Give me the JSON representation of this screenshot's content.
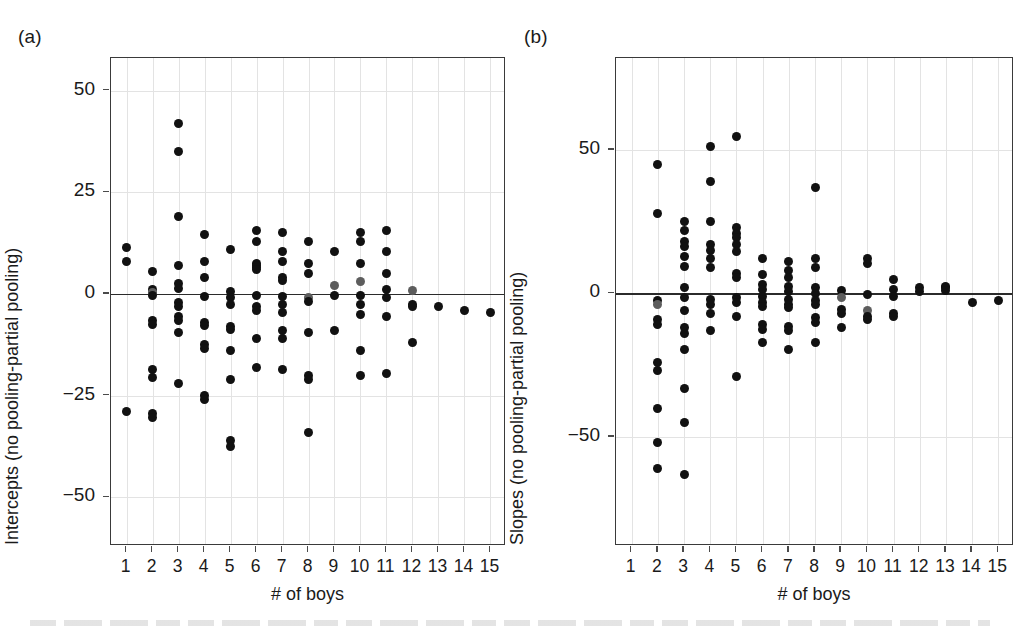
{
  "figure": {
    "background": "#ffffff",
    "point_color": "#111111",
    "point_color_faded": "#5d5d5d",
    "axis_color": "#3a3a3a",
    "grid_color": "#e3e3e3",
    "zero_line_color": "#2b2b2b"
  },
  "panels": [
    {
      "label": "(a)",
      "frame": {
        "left": 110,
        "top": 57,
        "width": 395,
        "height": 488
      },
      "label_pos": {
        "left": 18,
        "top": 26
      },
      "chart_data": {
        "type": "scatter",
        "title": "",
        "xlabel": "# of boys",
        "ylabel": "Intercepts (no pooling-partial pooling)",
        "xlim": [
          0.4,
          15.6
        ],
        "ylim": [
          -62,
          58
        ],
        "xticks": [
          1,
          2,
          3,
          4,
          5,
          6,
          7,
          8,
          9,
          10,
          11,
          12,
          13,
          14,
          15
        ],
        "yticks": [
          50,
          25,
          0,
          -25,
          -50
        ],
        "grid": true,
        "zero_reference_line": 0,
        "points": [
          [
            1,
            11.5
          ],
          [
            1,
            8.0
          ],
          [
            2,
            5.5
          ],
          [
            2,
            1.0
          ],
          [
            2,
            0.4
          ],
          [
            2,
            -0.4
          ],
          [
            2,
            -6.5
          ],
          [
            2,
            -7.5
          ],
          [
            2,
            -18.5
          ],
          [
            2,
            -20.5
          ],
          [
            2,
            -29.5
          ],
          [
            2,
            -30.5
          ],
          [
            1,
            -29.0
          ],
          [
            3,
            42.0
          ],
          [
            3,
            35.0
          ],
          [
            3,
            19.0
          ],
          [
            3,
            7.0
          ],
          [
            3,
            2.5
          ],
          [
            3,
            1.2
          ],
          [
            3,
            -2.0
          ],
          [
            3,
            -3.0
          ],
          [
            3,
            -5.5
          ],
          [
            3,
            -6.5
          ],
          [
            3,
            -9.5
          ],
          [
            3,
            -22.0
          ],
          [
            4,
            14.5
          ],
          [
            4,
            8.0
          ],
          [
            4,
            4.0
          ],
          [
            4,
            -0.6
          ],
          [
            4,
            -7.0
          ],
          [
            4,
            -7.8
          ],
          [
            4,
            -12.5
          ],
          [
            4,
            -13.5
          ],
          [
            4,
            -25.0
          ],
          [
            4,
            -26.0
          ],
          [
            5,
            11.0
          ],
          [
            5,
            0.5
          ],
          [
            5,
            -0.8
          ],
          [
            5,
            -2.5
          ],
          [
            5,
            -8.0
          ],
          [
            5,
            -8.8
          ],
          [
            5,
            -14.0
          ],
          [
            5,
            -21.0
          ],
          [
            5,
            -36.0
          ],
          [
            5,
            -37.5
          ],
          [
            6,
            13.0
          ],
          [
            6,
            15.5
          ],
          [
            6,
            7.5
          ],
          [
            6,
            6.5
          ],
          [
            6,
            7.0
          ],
          [
            6,
            6.0
          ],
          [
            6,
            -0.5
          ],
          [
            6,
            -3.0
          ],
          [
            6,
            -4.0
          ],
          [
            6,
            -11.0
          ],
          [
            6,
            -18.0
          ],
          [
            7,
            15.0
          ],
          [
            7,
            10.5
          ],
          [
            7,
            8.0
          ],
          [
            7,
            4.0
          ],
          [
            7,
            3.2
          ],
          [
            7,
            -0.6
          ],
          [
            7,
            -2.5
          ],
          [
            7,
            -4.5
          ],
          [
            7,
            -9.0
          ],
          [
            7,
            -11.0
          ],
          [
            7,
            -18.5
          ],
          [
            8,
            13.0
          ],
          [
            8,
            7.5
          ],
          [
            8,
            5.0
          ],
          [
            8,
            -1.0
          ],
          [
            8,
            -1.8
          ],
          [
            8,
            -9.5
          ],
          [
            8,
            -20.0
          ],
          [
            8,
            -21.0
          ],
          [
            8,
            -34.0
          ],
          [
            9,
            10.5
          ],
          [
            9,
            2.0
          ],
          [
            9,
            -0.5
          ],
          [
            9,
            -9.0
          ],
          [
            10,
            15.0
          ],
          [
            10,
            13.0
          ],
          [
            10,
            7.5
          ],
          [
            10,
            3.0
          ],
          [
            10,
            -0.5
          ],
          [
            10,
            -2.5
          ],
          [
            10,
            -5.0
          ],
          [
            10,
            -14.0
          ],
          [
            10,
            -20.0
          ],
          [
            11,
            15.5
          ],
          [
            11,
            10.5
          ],
          [
            11,
            5.0
          ],
          [
            11,
            1.0
          ],
          [
            11,
            -0.8
          ],
          [
            11,
            -5.5
          ],
          [
            11,
            -19.5
          ],
          [
            12,
            0.8
          ],
          [
            12,
            -2.5
          ],
          [
            12,
            -3.2
          ],
          [
            12,
            -12.0
          ],
          [
            13,
            -3.0
          ],
          [
            14,
            -4.0
          ],
          [
            15,
            -4.5
          ]
        ],
        "faded_points": [
          [
            2,
            0.4
          ],
          [
            9,
            2.0
          ],
          [
            10,
            3.0
          ],
          [
            12,
            0.8
          ],
          [
            8,
            -1.0
          ]
        ]
      }
    },
    {
      "label": "(b)",
      "frame": {
        "left": 615,
        "top": 57,
        "width": 398,
        "height": 488
      },
      "label_pos": {
        "left": 524,
        "top": 26
      },
      "chart_data": {
        "type": "scatter",
        "title": "",
        "xlabel": "# of boys",
        "ylabel": "Slopes (no pooling-partial pooling)",
        "xlim": [
          0.4,
          15.6
        ],
        "ylim": [
          -88,
          82
        ],
        "xticks": [
          1,
          2,
          3,
          4,
          5,
          6,
          7,
          8,
          9,
          10,
          11,
          12,
          13,
          14,
          15
        ],
        "yticks": [
          50,
          0,
          -50
        ],
        "grid": true,
        "zero_reference_line": 0,
        "points": [
          [
            2,
            45.0
          ],
          [
            2,
            28.0
          ],
          [
            2,
            -2.5
          ],
          [
            2,
            -4.0
          ],
          [
            2,
            -9.0
          ],
          [
            2,
            -11.0
          ],
          [
            2,
            -24.0
          ],
          [
            2,
            -27.0
          ],
          [
            2,
            -40.0
          ],
          [
            2,
            -52.0
          ],
          [
            2,
            -61.0
          ],
          [
            3,
            25.0
          ],
          [
            3,
            22.0
          ],
          [
            3,
            18.0
          ],
          [
            3,
            16.5
          ],
          [
            3,
            13.0
          ],
          [
            3,
            9.5
          ],
          [
            3,
            2.0
          ],
          [
            3,
            -1.5
          ],
          [
            3,
            -6.0
          ],
          [
            3,
            -12.0
          ],
          [
            3,
            -14.0
          ],
          [
            3,
            -19.5
          ],
          [
            3,
            -33.0
          ],
          [
            3,
            -45.0
          ],
          [
            3,
            -63.0
          ],
          [
            4,
            51.0
          ],
          [
            4,
            39.0
          ],
          [
            4,
            25.0
          ],
          [
            4,
            17.0
          ],
          [
            4,
            15.0
          ],
          [
            4,
            12.0
          ],
          [
            4,
            9.0
          ],
          [
            4,
            -2.0
          ],
          [
            4,
            -4.0
          ],
          [
            4,
            -7.0
          ],
          [
            4,
            -13.0
          ],
          [
            5,
            54.5
          ],
          [
            5,
            23.0
          ],
          [
            5,
            21.0
          ],
          [
            5,
            19.5
          ],
          [
            5,
            17.0
          ],
          [
            5,
            14.5
          ],
          [
            5,
            7.0
          ],
          [
            5,
            5.5
          ],
          [
            5,
            -1.5
          ],
          [
            5,
            -3.0
          ],
          [
            5,
            -8.0
          ],
          [
            5,
            -29.0
          ],
          [
            6,
            12.0
          ],
          [
            6,
            6.5
          ],
          [
            6,
            3.0
          ],
          [
            6,
            1.5
          ],
          [
            6,
            -1.0
          ],
          [
            6,
            -3.0
          ],
          [
            6,
            -4.5
          ],
          [
            6,
            -11.0
          ],
          [
            6,
            -12.5
          ],
          [
            6,
            -17.0
          ],
          [
            7,
            11.0
          ],
          [
            7,
            8.0
          ],
          [
            7,
            5.5
          ],
          [
            7,
            2.5
          ],
          [
            7,
            0.5
          ],
          [
            7,
            -2.0
          ],
          [
            7,
            -4.0
          ],
          [
            7,
            -5.0
          ],
          [
            7,
            -11.5
          ],
          [
            7,
            -13.0
          ],
          [
            7,
            -19.5
          ],
          [
            8,
            37.0
          ],
          [
            8,
            12.0
          ],
          [
            8,
            9.0
          ],
          [
            8,
            2.0
          ],
          [
            8,
            0.0
          ],
          [
            8,
            -2.5
          ],
          [
            8,
            -4.0
          ],
          [
            8,
            -8.5
          ],
          [
            8,
            -10.0
          ],
          [
            8,
            -17.0
          ],
          [
            9,
            1.0
          ],
          [
            9,
            -1.5
          ],
          [
            9,
            -5.5
          ],
          [
            9,
            -7.0
          ],
          [
            9,
            -12.0
          ],
          [
            10,
            12.0
          ],
          [
            10,
            10.5
          ],
          [
            10,
            -0.5
          ],
          [
            10,
            -6.0
          ],
          [
            10,
            -8.0
          ],
          [
            10,
            -9.0
          ],
          [
            11,
            5.0
          ],
          [
            11,
            1.5
          ],
          [
            11,
            -1.0
          ],
          [
            11,
            -7.0
          ],
          [
            11,
            -8.0
          ],
          [
            12,
            2.0
          ],
          [
            12,
            0.5
          ],
          [
            13,
            2.5
          ],
          [
            13,
            2.0
          ],
          [
            13,
            1.0
          ],
          [
            14,
            -3.0
          ],
          [
            15,
            -2.5
          ]
        ],
        "faded_points": [
          [
            2,
            -4.0
          ],
          [
            9,
            -1.5
          ],
          [
            10,
            -6.0
          ]
        ]
      }
    }
  ]
}
